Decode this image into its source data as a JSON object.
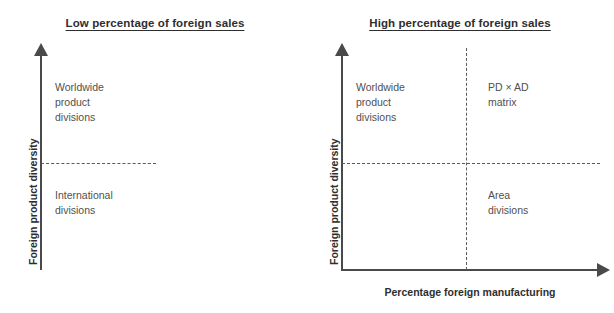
{
  "figure": {
    "background_color": "#ffffff",
    "line_color": "#4a4a4a",
    "dash_color": "#5a5a5a",
    "text_color": "#505050"
  },
  "panels": [
    {
      "id": "low-foreign-sales",
      "title": "Low percentage of foreign sales",
      "y_axis_label": "Foreign product diversity",
      "x_axis_label": "",
      "cells": [
        {
          "id": "worldwide-product-divisions",
          "text": "Worldwide\nproduct\ndivisions"
        },
        {
          "id": "international-divisions",
          "text": "International\ndivisions"
        }
      ]
    },
    {
      "id": "high-foreign-sales",
      "title": "High percentage of foreign sales",
      "y_axis_label": "Foreign product diversity",
      "x_axis_label": "Percentage foreign manufacturing",
      "cells": [
        {
          "id": "worldwide-product-divisions",
          "text": "Worldwide\nproduct\ndivisions"
        },
        {
          "id": "pd-ad-matrix",
          "text": "PD × AD\nmatrix"
        },
        {
          "id": "area-divisions",
          "text": "Area\ndivisions"
        }
      ]
    }
  ]
}
